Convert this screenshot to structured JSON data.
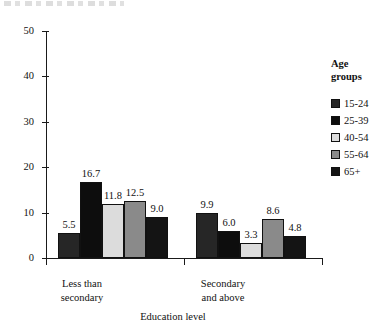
{
  "chart_data": {
    "type": "bar",
    "title": "",
    "xlabel": "Education level",
    "ylabel": "",
    "ylim": [
      0,
      50
    ],
    "yticks": [
      0,
      10,
      20,
      30,
      40,
      50
    ],
    "grid": false,
    "legend_position": "right",
    "legend_title": "Age groups",
    "categories": [
      "Less than secondary",
      "Secondary and above"
    ],
    "category_lines": [
      [
        "Less than",
        "secondary"
      ],
      [
        "Secondary",
        "and above"
      ]
    ],
    "series": [
      {
        "name": "15-24",
        "color": "#262626",
        "values": [
          5.5,
          9.9
        ],
        "labels": [
          "5.5",
          "9.9"
        ]
      },
      {
        "name": "25-39",
        "color": "#0d0d0d",
        "values": [
          16.7,
          6.0
        ],
        "labels": [
          "16.7",
          "6.0"
        ]
      },
      {
        "name": "40-54",
        "color": "#dcdcdc",
        "values": [
          11.8,
          3.3
        ],
        "labels": [
          "11.8",
          "3.3"
        ]
      },
      {
        "name": "55-64",
        "color": "#8a8a8a",
        "values": [
          12.5,
          8.6
        ],
        "labels": [
          "12.5",
          "8.6"
        ]
      },
      {
        "name": "65+",
        "color": "#141414",
        "values": [
          9.0,
          4.8
        ],
        "labels": [
          "9.0",
          "4.8"
        ]
      }
    ]
  },
  "axes": {
    "y_tick_labels": [
      "50",
      "40",
      "30",
      "20",
      "10",
      "0"
    ],
    "x_axis_title": "Education level"
  },
  "legend": {
    "title_line1": "Age",
    "title_line2": "groups",
    "items": [
      {
        "label": "15-24",
        "color": "#262626"
      },
      {
        "label": "25-39",
        "color": "#0d0d0d"
      },
      {
        "label": "40-54",
        "color": "#dcdcdc"
      },
      {
        "label": "55-64",
        "color": "#8a8a8a"
      },
      {
        "label": "65+",
        "color": "#141414"
      }
    ]
  }
}
